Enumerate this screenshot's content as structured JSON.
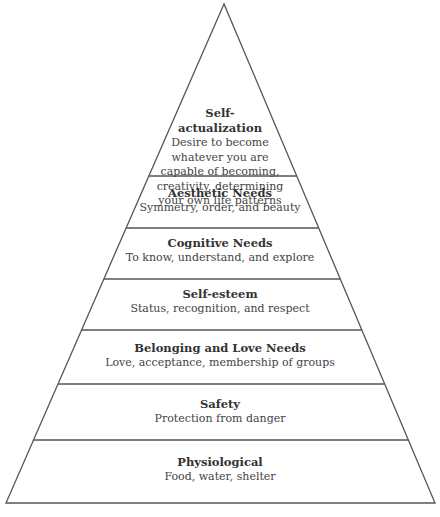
{
  "colors": {
    "line": "#555555",
    "text": "#333333",
    "background": "#ffffff"
  },
  "levels": [
    {
      "title": "Self-\nactualization",
      "description": "Desire to become whatever you are capable of becoming, creativity, determining your own life patterns"
    },
    {
      "title": "Aesthetic Needs",
      "description": "Symmetry, order, and beauty"
    },
    {
      "title": "Cognitive Needs",
      "description": "To know, understand, and explore"
    },
    {
      "title": "Self-esteem",
      "description": "Status, recognition, and respect"
    },
    {
      "title": "Belonging and Love Needs",
      "description": "Love, acceptance, membership of groups"
    },
    {
      "title": "Safety",
      "description": "Protection from danger"
    },
    {
      "title": "Physiological",
      "description": "Food, water, shelter"
    }
  ],
  "top_level_lines": {
    "title": [
      "Self-",
      "actualization"
    ],
    "description": [
      "Desire to become",
      "whatever you are",
      "capable of becoming,",
      "creativity, determining",
      "your own life patterns"
    ]
  }
}
